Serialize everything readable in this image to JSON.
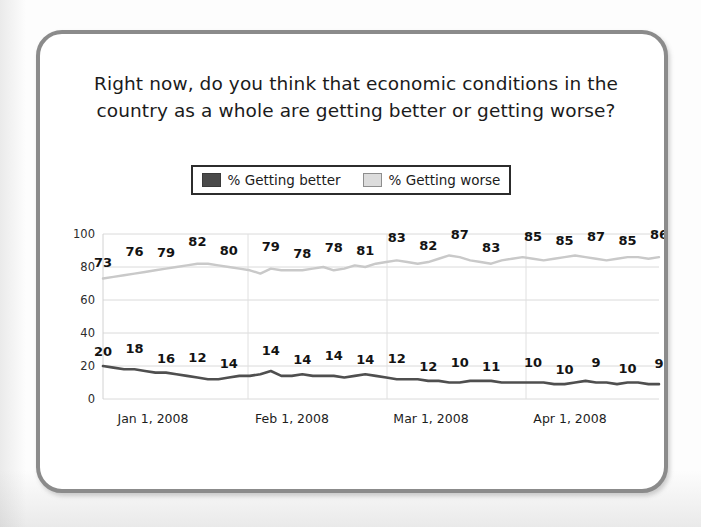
{
  "card": {
    "border_color": "#8b8b8b"
  },
  "title": {
    "line1": "Right now, do you think that economic conditions in the",
    "line2": "country as a whole are getting better or getting worse?"
  },
  "legend": {
    "position": "top-center",
    "items": [
      {
        "label": "% Getting better",
        "color": "#4a4a4a",
        "swatch": "dark"
      },
      {
        "label": "% Getting worse",
        "color": "#dcdcdc",
        "swatch": "light"
      }
    ]
  },
  "chart_data": {
    "type": "line",
    "title": "Right now, do you think that economic conditions in the country as a whole are getting better or getting worse?",
    "xlabel": "",
    "ylabel": "",
    "ylim": [
      0,
      100
    ],
    "yticks": [
      0,
      20,
      40,
      60,
      80,
      100
    ],
    "grid": true,
    "x_tick_labels": [
      "Jan 1, 2008",
      "Feb 1, 2008",
      "Mar 1, 2008",
      "Apr 1, 2008"
    ],
    "series": [
      {
        "name": "% Getting worse",
        "color": "#c9c9c9",
        "labels": [
          73,
          76,
          79,
          82,
          80,
          79,
          78,
          78,
          81,
          83,
          82,
          87,
          83,
          85,
          85,
          87,
          85,
          86
        ],
        "values": [
          73,
          74,
          75,
          76,
          77,
          78,
          79,
          80,
          81,
          82,
          82,
          81,
          80,
          79,
          78,
          76,
          79,
          78,
          78,
          78,
          79,
          80,
          78,
          79,
          81,
          80,
          82,
          83,
          84,
          83,
          82,
          83,
          85,
          87,
          86,
          84,
          83,
          82,
          84,
          85,
          86,
          85,
          84,
          85,
          86,
          87,
          86,
          85,
          84,
          85,
          86,
          86,
          85,
          86
        ]
      },
      {
        "name": "% Getting better",
        "color": "#4f4f4f",
        "labels": [
          20,
          18,
          16,
          12,
          14,
          14,
          14,
          14,
          14,
          12,
          12,
          10,
          11,
          10,
          10,
          9,
          10,
          9
        ],
        "values": [
          20,
          19,
          18,
          18,
          17,
          16,
          16,
          15,
          14,
          13,
          12,
          12,
          13,
          14,
          14,
          15,
          17,
          14,
          14,
          15,
          14,
          14,
          14,
          13,
          14,
          15,
          14,
          13,
          12,
          12,
          12,
          11,
          11,
          10,
          10,
          11,
          11,
          11,
          10,
          10,
          10,
          10,
          10,
          9,
          9,
          10,
          11,
          10,
          10,
          9,
          10,
          10,
          9,
          9
        ]
      }
    ]
  }
}
